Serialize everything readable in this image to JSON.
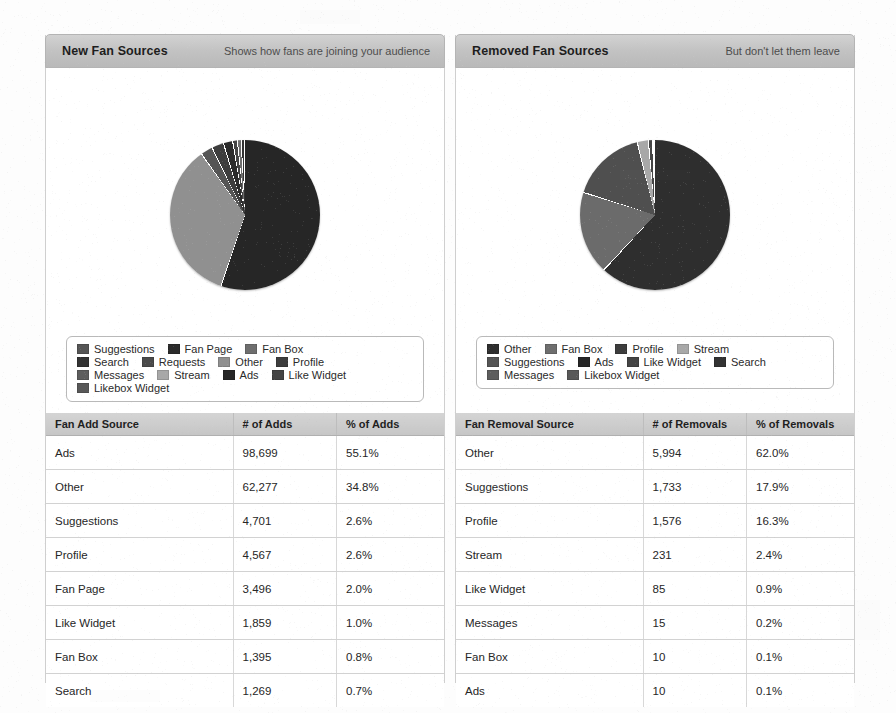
{
  "page": {
    "background": "#fdfdfd"
  },
  "palette": {
    "suggestions": "#555555",
    "fan_page": "#2b2b2b",
    "fan_box": "#6e6e6e",
    "search": "#333333",
    "requests": "#4a4a4a",
    "other": "#909090",
    "profile": "#3d3d3d",
    "messages": "#5d5d5d",
    "stream": "#a8a8a8",
    "ads": "#262626",
    "like_widget": "#444444",
    "likebox_widget": "#585858"
  },
  "panels": [
    {
      "id": "new-fan-sources",
      "title": "New Fan Sources",
      "subtitle": "Shows how fans are joining your audience",
      "legend_rows": [
        [
          {
            "label": "Suggestions",
            "color_key": "suggestions"
          },
          {
            "label": "Fan Page",
            "color_key": "fan_page"
          },
          {
            "label": "Fan Box",
            "color_key": "fan_box"
          }
        ],
        [
          {
            "label": "Search",
            "color_key": "search"
          },
          {
            "label": "Requests",
            "color_key": "requests"
          },
          {
            "label": "Other",
            "color_key": "other"
          },
          {
            "label": "Profile",
            "color_key": "profile"
          }
        ],
        [
          {
            "label": "Messages",
            "color_key": "messages"
          },
          {
            "label": "Stream",
            "color_key": "stream"
          },
          {
            "label": "Ads",
            "color_key": "ads"
          },
          {
            "label": "Like Widget",
            "color_key": "like_widget"
          }
        ],
        [
          {
            "label": "Likebox Widget",
            "color_key": "likebox_widget"
          }
        ]
      ],
      "table": {
        "columns": [
          "Fan Add Source",
          "# of Adds",
          "% of Adds"
        ],
        "rows": [
          [
            "Ads",
            "98,699",
            "55.1%"
          ],
          [
            "Other",
            "62,277",
            "34.8%"
          ],
          [
            "Suggestions",
            "4,701",
            "2.6%"
          ],
          [
            "Profile",
            "4,567",
            "2.6%"
          ],
          [
            "Fan Page",
            "3,496",
            "2.0%"
          ],
          [
            "Like Widget",
            "1,859",
            "1.0%"
          ],
          [
            "Fan Box",
            "1,395",
            "0.8%"
          ],
          [
            "Search",
            "1,269",
            "0.7%"
          ]
        ]
      }
    },
    {
      "id": "removed-fan-sources",
      "title": "Removed Fan Sources",
      "subtitle": "But don't let them leave",
      "legend_rows": [
        [
          {
            "label": "Other",
            "color_key": "other_dark"
          },
          {
            "label": "Fan Box",
            "color_key": "fan_box"
          },
          {
            "label": "Profile",
            "color_key": "profile"
          },
          {
            "label": "Stream",
            "color_key": "stream"
          }
        ],
        [
          {
            "label": "Suggestions",
            "color_key": "suggestions"
          },
          {
            "label": "Ads",
            "color_key": "ads"
          },
          {
            "label": "Like Widget",
            "color_key": "like_widget"
          },
          {
            "label": "Search",
            "color_key": "search"
          }
        ],
        [
          {
            "label": "Messages",
            "color_key": "messages"
          },
          {
            "label": "Likebox Widget",
            "color_key": "likebox_widget"
          }
        ]
      ],
      "table": {
        "columns": [
          "Fan Removal Source",
          "# of Removals",
          "% of Removals"
        ],
        "rows": [
          [
            "Other",
            "5,994",
            "62.0%"
          ],
          [
            "Suggestions",
            "1,733",
            "17.9%"
          ],
          [
            "Profile",
            "1,576",
            "16.3%"
          ],
          [
            "Stream",
            "231",
            "2.4%"
          ],
          [
            "Like Widget",
            "85",
            "0.9%"
          ],
          [
            "Messages",
            "15",
            "0.2%"
          ],
          [
            "Fan Box",
            "10",
            "0.1%"
          ],
          [
            "Ads",
            "10",
            "0.1%"
          ]
        ]
      }
    }
  ],
  "chart_data": [
    {
      "type": "pie",
      "title": "New Fan Sources",
      "subtitle": "Shows how fans are joining your audience",
      "labels": [
        "Ads",
        "Other",
        "Suggestions",
        "Profile",
        "Fan Page",
        "Like Widget",
        "Fan Box",
        "Search"
      ],
      "values": [
        98699,
        62277,
        4701,
        4567,
        3496,
        1859,
        1395,
        1269
      ],
      "percents": [
        55.1,
        34.8,
        2.6,
        2.6,
        2.0,
        1.0,
        0.8,
        0.7
      ],
      "colors": [
        "#262626",
        "#909090",
        "#555555",
        "#3d3d3d",
        "#2b2b2b",
        "#444444",
        "#6e6e6e",
        "#333333"
      ],
      "legend_position": "below",
      "start_angle_deg": -90,
      "value_label": "# of Adds",
      "percent_label": "% of Adds",
      "category_label": "Fan Add Source"
    },
    {
      "type": "pie",
      "title": "Removed Fan Sources",
      "subtitle": "But don't let them leave",
      "labels": [
        "Other",
        "Suggestions",
        "Profile",
        "Stream",
        "Like Widget",
        "Messages",
        "Fan Box",
        "Ads"
      ],
      "values": [
        5994,
        1733,
        1576,
        231,
        85,
        15,
        10,
        10
      ],
      "percents": [
        62.0,
        17.9,
        16.3,
        2.4,
        0.9,
        0.2,
        0.1,
        0.1
      ],
      "colors": [
        "#2e2e2e",
        "#6b6b6b",
        "#4f4f4f",
        "#a8a8a8",
        "#444444",
        "#5d5d5d",
        "#6e6e6e",
        "#262626"
      ],
      "legend_position": "below",
      "start_angle_deg": -90,
      "value_label": "# of Removals",
      "percent_label": "% of Removals",
      "category_label": "Fan Removal Source"
    }
  ]
}
